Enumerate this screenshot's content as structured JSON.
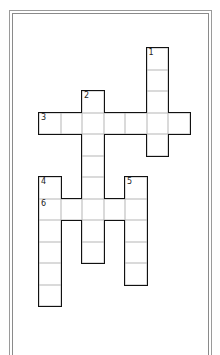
{
  "puzzle": {
    "origin": {
      "x": 39,
      "y": 48
    },
    "cell_size": 21.5,
    "words": [
      {
        "number": "1",
        "direction": "down",
        "col": 5,
        "row": 0,
        "length": 5
      },
      {
        "number": "2",
        "direction": "down",
        "col": 2,
        "row": 2,
        "length": 8
      },
      {
        "number": "3",
        "direction": "across",
        "col": 0,
        "row": 3,
        "length": 7
      },
      {
        "number": "4",
        "direction": "down",
        "col": 0,
        "row": 6,
        "length": 6
      },
      {
        "number": "5",
        "direction": "down",
        "col": 4,
        "row": 6,
        "length": 5
      },
      {
        "number": "6",
        "direction": "across",
        "col": 0,
        "row": 7,
        "length": 5
      }
    ]
  },
  "colors": {
    "frame": "#9a9a9a",
    "cell_line": "#b5b5b5",
    "outline": "#111111"
  }
}
